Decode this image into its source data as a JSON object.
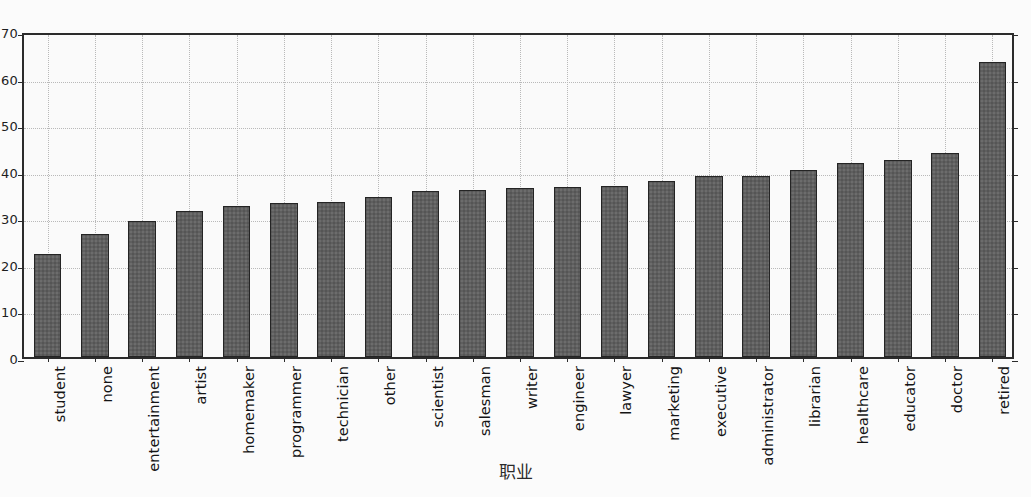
{
  "chart_data": {
    "type": "bar",
    "title": "",
    "xlabel": "职业",
    "ylabel": "",
    "ylim": [
      0,
      70
    ],
    "yticks": [
      0,
      10,
      20,
      30,
      40,
      50,
      60,
      70
    ],
    "grid": true,
    "legend": "none",
    "bar_color": "#5f5f5f",
    "bar_edge_color": "#242424",
    "categories": [
      "student",
      "none",
      "entertainment",
      "artist",
      "homemaker",
      "programmer",
      "technician",
      "other",
      "scientist",
      "salesman",
      "writer",
      "engineer",
      "lawyer",
      "marketing",
      "executive",
      "administrator",
      "librarian",
      "healthcare",
      "educator",
      "doctor",
      "retired"
    ],
    "values": [
      22.1,
      26.5,
      29.2,
      31.3,
      32.5,
      33.1,
      33.2,
      34.4,
      35.6,
      35.8,
      36.2,
      36.4,
      36.8,
      37.8,
      38.8,
      38.9,
      40.2,
      41.7,
      42.2,
      43.8,
      63.4
    ]
  }
}
